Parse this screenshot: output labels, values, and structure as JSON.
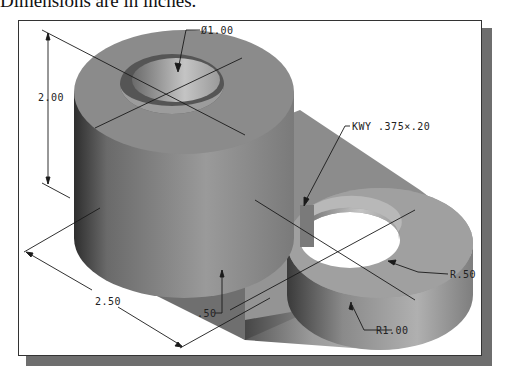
{
  "caption": "Dimensions are in inches.",
  "drawing": {
    "title": "Isometric part with keyway",
    "units": "inches",
    "dimensions": {
      "height": "2.00",
      "bore_diameter": "Ø1.00",
      "keyway": "KWY .375×.20",
      "inner_radius": "R.50",
      "outer_radius": "R1.00",
      "length": "2.50",
      "base_thickness": ".50"
    }
  },
  "colors": {
    "frame_shadow": "#6e6e6e",
    "part_dark": "#4a4a4a",
    "part_mid": "#8a8a8a",
    "part_light": "#bdbdbd"
  }
}
